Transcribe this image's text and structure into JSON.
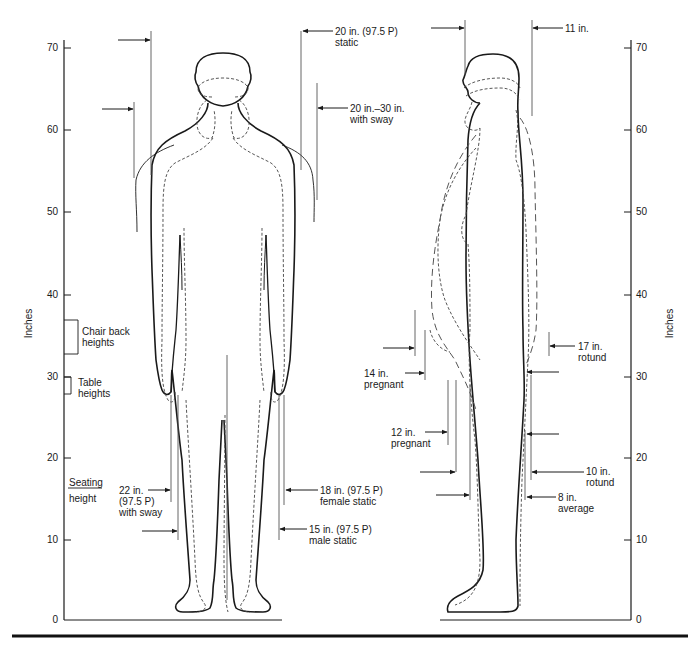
{
  "axes": {
    "left": {
      "title": "Inches",
      "ticks": [
        "70",
        "60",
        "50",
        "40",
        "30",
        "20",
        "10",
        "0"
      ]
    },
    "right": {
      "title": "Inches",
      "ticks": [
        "70",
        "60",
        "50",
        "40",
        "30",
        "20",
        "10",
        "0"
      ]
    }
  },
  "left_reference": {
    "chair_back": [
      "Chair back",
      "heights"
    ],
    "table": [
      "Table",
      "heights"
    ],
    "seating": [
      "Seating",
      "height"
    ]
  },
  "front_view": {
    "top_right_1": [
      "20 in. (97.5 P)",
      "static"
    ],
    "top_right_2": [
      "20 in.–30 in.",
      "with sway"
    ],
    "bottom_left": [
      "22 in.",
      "(97.5 P)",
      "with sway"
    ],
    "bottom_right_1": [
      "18 in. (97.5 P)",
      "female static"
    ],
    "bottom_right_2": [
      "15 in. (97.5 P)",
      "male static"
    ]
  },
  "side_view": {
    "top": "11 in.",
    "pregnant_14": [
      "14 in.",
      "pregnant"
    ],
    "pregnant_12": [
      "12 in.",
      "pregnant"
    ],
    "rotund_17": [
      "17 in.",
      "rotund"
    ],
    "rotund_10": [
      "10 in.",
      "rotund"
    ],
    "average_8": [
      "8 in.",
      "average"
    ]
  }
}
